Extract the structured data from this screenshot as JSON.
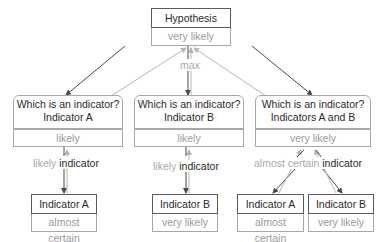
{
  "root": {
    "title": "Hypothesis",
    "value": "very likely",
    "aggregation_label": "max"
  },
  "branches": [
    {
      "question": "Which is an indicator?",
      "answer": "Indicator A",
      "value": "likely",
      "edge_label": {
        "qualifier": "likely",
        "keyword": "indicator"
      },
      "leaves": [
        {
          "title": "Indicator A",
          "value": "almost certain"
        }
      ]
    },
    {
      "question": "Which is an indicator?",
      "answer": "Indicator B",
      "value": "likely",
      "edge_label": {
        "qualifier": "likely",
        "keyword": "indicator"
      },
      "leaves": [
        {
          "title": "Indicator B",
          "value": "very likely"
        }
      ]
    },
    {
      "question": "Which is an indicator?",
      "answer": "Indicators A and B",
      "value": "very likely",
      "edge_label": {
        "qualifier": "almost certain",
        "keyword": "indicator"
      },
      "leaves": [
        {
          "title": "Indicator A",
          "value": "almost certain"
        },
        {
          "title": "Indicator B",
          "value": "very likely"
        }
      ]
    }
  ],
  "colors": {
    "dark_stroke": "#4a4a4a",
    "light_stroke": "#b5b5b5",
    "value_text": "#9a9a9a",
    "label_text": "#2a2a2a"
  }
}
